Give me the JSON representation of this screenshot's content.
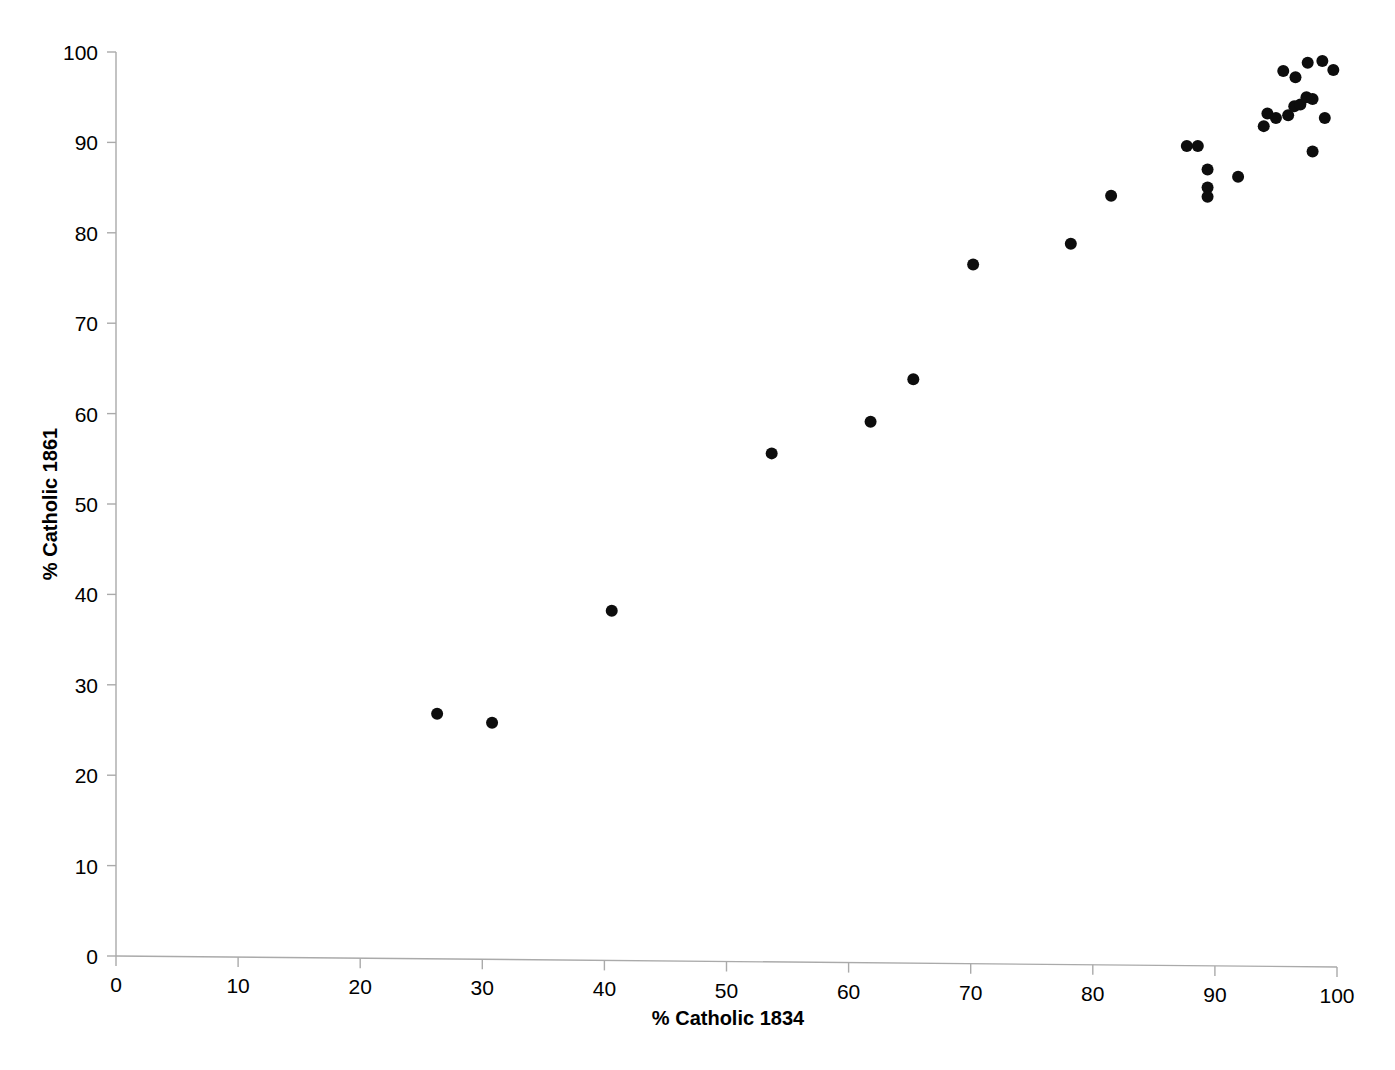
{
  "chart_data": {
    "type": "scatter",
    "title": "",
    "xlabel": "% Catholic 1834",
    "ylabel": "% Catholic 1861",
    "xlim": [
      0,
      100
    ],
    "ylim": [
      0,
      100
    ],
    "grid": false,
    "legend": null,
    "xticks": [
      0,
      10,
      20,
      30,
      40,
      50,
      60,
      70,
      80,
      90,
      100
    ],
    "yticks": [
      0,
      10,
      20,
      30,
      40,
      50,
      60,
      70,
      80,
      90,
      100
    ],
    "xtick_labels": [
      "0",
      "10",
      "20",
      "30",
      "40",
      "50",
      "60",
      "70",
      "80",
      "90",
      "100"
    ],
    "ytick_labels": [
      "0",
      "10",
      "20",
      "30",
      "40",
      "50",
      "60",
      "70",
      "80",
      "90",
      "100"
    ],
    "marker": {
      "shape": "circle",
      "color": "#0d0d0d",
      "size": 6
    },
    "series": [
      {
        "name": "parishes",
        "points": [
          [
            26.3,
            26.8
          ],
          [
            30.8,
            25.8
          ],
          [
            40.6,
            38.2
          ],
          [
            53.7,
            55.6
          ],
          [
            61.8,
            59.1
          ],
          [
            65.3,
            63.8
          ],
          [
            70.2,
            76.5
          ],
          [
            78.2,
            78.8
          ],
          [
            81.5,
            84.1
          ],
          [
            87.7,
            89.6
          ],
          [
            88.6,
            89.6
          ],
          [
            89.4,
            87.0
          ],
          [
            89.4,
            85.0
          ],
          [
            89.4,
            84.0
          ],
          [
            91.9,
            86.2
          ],
          [
            94.0,
            91.8
          ],
          [
            94.3,
            93.2
          ],
          [
            95.0,
            92.7
          ],
          [
            95.6,
            97.9
          ],
          [
            96.0,
            93.0
          ],
          [
            96.5,
            94.0
          ],
          [
            96.6,
            97.2
          ],
          [
            97.0,
            94.2
          ],
          [
            97.5,
            95.0
          ],
          [
            97.6,
            98.8
          ],
          [
            98.0,
            94.8
          ],
          [
            98.0,
            89.0
          ],
          [
            98.8,
            99.0
          ],
          [
            99.0,
            92.7
          ],
          [
            99.7,
            98.0
          ]
        ]
      }
    ]
  }
}
